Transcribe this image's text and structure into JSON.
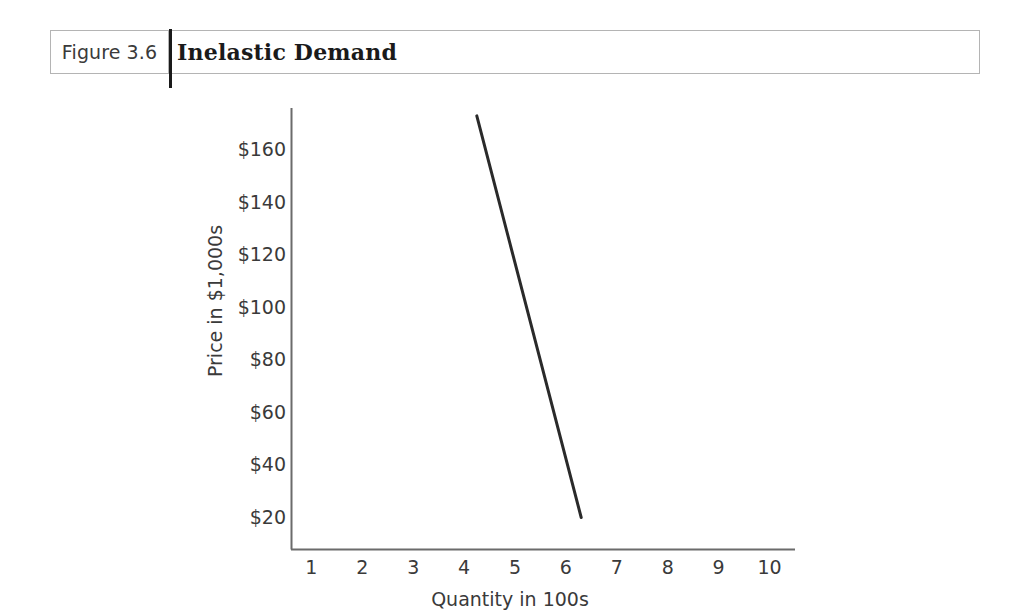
{
  "figure": {
    "number_label": "Figure 3.6",
    "title": "Inelastic Demand"
  },
  "chart_data": {
    "type": "line",
    "title": "Inelastic Demand",
    "xlabel": "Quantity in 100s",
    "ylabel": "Price in $1,000s",
    "x_tick_labels": [
      "1",
      "2",
      "3",
      "4",
      "5",
      "6",
      "7",
      "8",
      "9",
      "10"
    ],
    "x_ticks": [
      1,
      2,
      3,
      4,
      5,
      6,
      7,
      8,
      9,
      10
    ],
    "y_tick_labels": [
      "$160",
      "$140",
      "$120",
      "$100",
      "$80",
      "$60",
      "$40",
      "$20"
    ],
    "y_ticks": [
      160,
      140,
      120,
      100,
      80,
      60,
      40,
      20
    ],
    "xlim": [
      0.6,
      10.5
    ],
    "ylim": [
      8,
      176
    ],
    "grid": false,
    "legend": null,
    "series": [
      {
        "name": "Demand",
        "x": [
          4.25,
          6.3
        ],
        "y": [
          173,
          20
        ],
        "color": "#2a2a2a",
        "line_width": 3
      }
    ]
  },
  "colors": {
    "line": "#2a2a2a",
    "axis": "#6b6b6b",
    "text": "#3a3a3a",
    "border": "#b4b4b4",
    "divider": "#1a1a1a",
    "background": "#ffffff"
  }
}
